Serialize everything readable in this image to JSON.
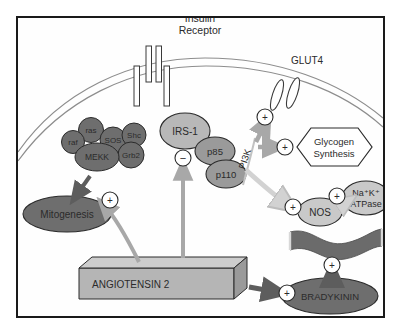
{
  "figure": {
    "title": "Insulin Receptor",
    "title_line1": "Insulin",
    "title_line2": "Receptor",
    "domain": "biological-signaling-pathway-diagram",
    "background_color": "#ffffff",
    "frame_color": "#1a1a1a"
  },
  "colors": {
    "dark_node": "#6e6e6e",
    "mid_node": "#9a9a9a",
    "light_node": "#b8b8b8",
    "pale_node": "#c9c9c9",
    "vessel": "#6b6b6b",
    "box_face": "#b5b5b5",
    "box_top": "#cdcdcd",
    "box_side": "#9a9a9a",
    "gray_arrow": "#a8a8a8",
    "dark_arrow": "#5d5d5d",
    "pale_arrow": "#d2d2d2",
    "membrane": "#8d8d8d",
    "outline": "#2b2b2b",
    "text": "#2b2b2b"
  },
  "membrane": {
    "label": "plasma-membrane",
    "style": "double-line-arc"
  },
  "receptor": {
    "name": "insulin-receptor",
    "label": "Insulin Receptor",
    "bars": 4
  },
  "nodes": {
    "mapk_cluster": [
      {
        "id": "raf",
        "label": "raf",
        "shape": "circle",
        "tone": "dark"
      },
      {
        "id": "ras",
        "label": "ras",
        "shape": "circle",
        "tone": "dark"
      },
      {
        "id": "sos",
        "label": "SOS",
        "shape": "circle",
        "tone": "dark"
      },
      {
        "id": "shc",
        "label": "Shc",
        "shape": "circle",
        "tone": "dark"
      },
      {
        "id": "grb2",
        "label": "Grb2",
        "shape": "circle",
        "tone": "dark"
      },
      {
        "id": "mekk",
        "label": "MEKK",
        "shape": "ellipse",
        "tone": "dark"
      }
    ],
    "irs1": {
      "label": "IRS-1",
      "shape": "ellipse",
      "tone": "light"
    },
    "p85": {
      "label": "p85",
      "shape": "ellipse",
      "tone": "mid"
    },
    "p110": {
      "label": "p110",
      "shape": "ellipse",
      "tone": "mid"
    },
    "pi3k": {
      "label": "PI3K",
      "rotated": true
    },
    "glut4": {
      "label": "GLUT4",
      "shape": "transporter"
    },
    "glycogen": {
      "label": "Glycogen Synthesis",
      "line1": "Glycogen",
      "line2": "Synthesis",
      "shape": "hexagon"
    },
    "nos": {
      "label": "NOS",
      "shape": "ellipse",
      "tone": "light"
    },
    "atpase": {
      "label": "Na+K+ ATPase",
      "line1": "Na⁺K⁺",
      "line2": "ATPase",
      "shape": "ellipse",
      "tone": "light"
    },
    "mitogenesis": {
      "label": "Mitogenesis",
      "shape": "ellipse",
      "tone": "dark"
    },
    "angiotensin2": {
      "label": "ANGIOTENSIN 2",
      "shape": "3d-box"
    },
    "bradykinin": {
      "label": "BRADYKININ",
      "shape": "ellipse",
      "tone": "dark"
    },
    "vessel": {
      "label": "blood-vessel",
      "shape": "wavy-band"
    }
  },
  "signs": {
    "plus": "+",
    "minus": "−",
    "nodes": [
      {
        "id": "plus-mitogenesis",
        "sign": "+"
      },
      {
        "id": "minus-irs1",
        "sign": "−"
      },
      {
        "id": "plus-glut4",
        "sign": "+"
      },
      {
        "id": "plus-glycogen",
        "sign": "+"
      },
      {
        "id": "plus-nos",
        "sign": "+"
      },
      {
        "id": "plus-atpase",
        "sign": "+"
      },
      {
        "id": "plus-vessel",
        "sign": "+"
      },
      {
        "id": "plus-bradykinin",
        "sign": "+"
      }
    ]
  }
}
